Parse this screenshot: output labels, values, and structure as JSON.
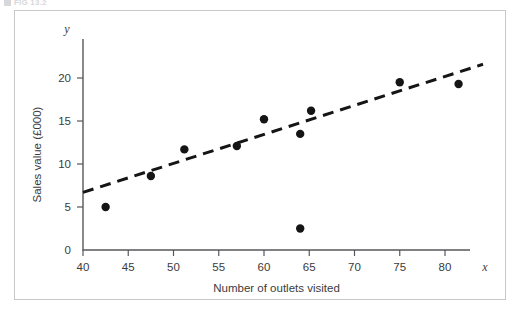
{
  "figure": {
    "caption": "FIG 13.2",
    "caption_marker": "square-marker"
  },
  "chart_data": {
    "type": "scatter",
    "title": "",
    "xlabel": "Number of outlets visited",
    "ylabel": "Sales value (£000)",
    "x_axis_symbol": "x",
    "y_axis_symbol": "y",
    "xlim": [
      40,
      85
    ],
    "ylim": [
      0,
      23
    ],
    "xticks": [
      40,
      45,
      50,
      55,
      60,
      65,
      70,
      75,
      80
    ],
    "yticks": [
      0,
      5,
      10,
      15,
      20
    ],
    "xtick_labels": [
      "40",
      "45",
      "50",
      "55",
      "60",
      "65",
      "70",
      "75",
      "80"
    ],
    "ytick_labels": [
      "0",
      "5",
      "10",
      "15",
      "20"
    ],
    "grid": false,
    "legend": false,
    "point_color": "#151515",
    "line_color": "#151515",
    "points": [
      {
        "x": 42.5,
        "y": 5.0
      },
      {
        "x": 47.5,
        "y": 8.6
      },
      {
        "x": 51.2,
        "y": 11.7
      },
      {
        "x": 57.0,
        "y": 12.1
      },
      {
        "x": 60.0,
        "y": 15.2
      },
      {
        "x": 64.0,
        "y": 13.5
      },
      {
        "x": 64.0,
        "y": 2.5
      },
      {
        "x": 65.2,
        "y": 16.2
      },
      {
        "x": 75.0,
        "y": 19.5
      },
      {
        "x": 81.5,
        "y": 19.3
      }
    ],
    "trend_line": {
      "style": "dashed",
      "x_start": 40.0,
      "y_start": 6.7,
      "x_end": 84.2,
      "y_end": 21.6
    }
  }
}
